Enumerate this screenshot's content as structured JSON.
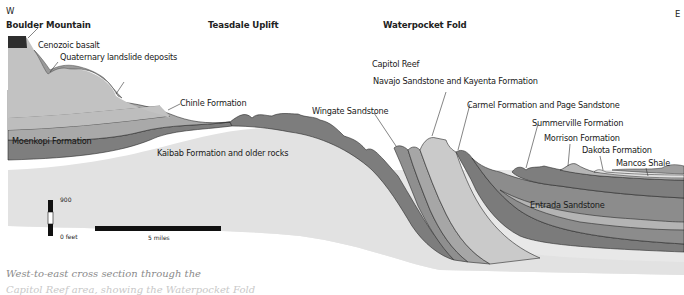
{
  "compass": {
    "west": "W",
    "east": "E"
  },
  "regions": [
    {
      "label": "Boulder Mountain"
    },
    {
      "label": "Teasdale Uplift"
    },
    {
      "label": "Waterpocket Fold"
    }
  ],
  "features": {
    "capitol_reef": "Capitol Reef"
  },
  "formations": [
    {
      "label": "Cenozoic basalt",
      "color": "#3a3a3a"
    },
    {
      "label": "Quaternary landslide deposits",
      "color": "#9a9a9a"
    },
    {
      "label": "Chinle Formation",
      "color": "#a8a8a8"
    },
    {
      "label": "Moenkopi Formation",
      "color": "#7c7c7c"
    },
    {
      "label": "Kaibab Formation and older rocks",
      "color": "#e6e6e6"
    },
    {
      "label": "Wingate Sandstone",
      "color": "#8e8e8e"
    },
    {
      "label": "Navajo Sandstone and Kayenta Formation",
      "color": "#c9c9c9"
    },
    {
      "label": "Carmel Formation and Page Sandstone",
      "color": "#7a7a7a"
    },
    {
      "label": "Summerville Formation",
      "color": "#8a8a8a"
    },
    {
      "label": "Morrison Formation",
      "color": "#b4b4b4"
    },
    {
      "label": "Dakota Formation",
      "color": "#d8d8d8"
    },
    {
      "label": "Mancos Shale",
      "color": "#9c9c9c"
    },
    {
      "label": "Entrada Sandstone",
      "color": "#8c8c8c"
    }
  ],
  "scale": {
    "vertical_top": "900",
    "vertical_bottom": "0 feet",
    "horizontal": "5 miles"
  },
  "caption": {
    "line1": "West-to-east cross section through the",
    "line2": "Capitol Reef area, showing the Waterpocket Fold"
  }
}
